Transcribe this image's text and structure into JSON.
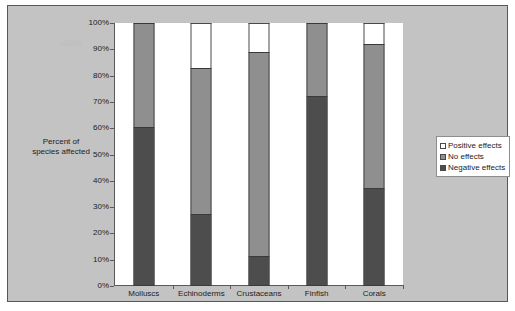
{
  "chart_data": {
    "type": "bar",
    "subtype": "stacked-bar-100-percent",
    "title": "",
    "xlabel": "",
    "ylabel": "Percent of species affected",
    "ylabel_lines": [
      "Percent of",
      "species affected"
    ],
    "categories": [
      "Molluscs",
      "Echinoderms",
      "Crustaceans",
      "Finfish",
      "Corals"
    ],
    "series": [
      {
        "name": "Negative effects",
        "color": "#4d4d4d",
        "values": [
          60,
          27,
          11,
          72,
          37
        ]
      },
      {
        "name": "No effects",
        "color": "#8f8f8f",
        "values": [
          40,
          56,
          78,
          28,
          55
        ]
      },
      {
        "name": "Positive effects",
        "color": "#ffffff",
        "values": [
          0,
          17,
          11,
          0,
          8
        ]
      }
    ],
    "stack_order_bottom_to_top": [
      "Negative effects",
      "No effects",
      "Positive effects"
    ],
    "ylim": [
      0,
      100
    ],
    "ytick_labels": [
      "100%",
      "90%",
      "80%",
      "70%",
      "60%",
      "50%",
      "40%",
      "30%",
      "20%",
      "10%",
      "0%"
    ],
    "ytick_values": [
      100,
      90,
      80,
      70,
      60,
      50,
      40,
      30,
      20,
      10,
      0
    ],
    "grid": false,
    "legend_position": "right-center",
    "legend_entries": [
      "Positive effects",
      "No effects",
      "Negative effects"
    ]
  },
  "legend": {
    "entries": [
      {
        "label": "Positive effects",
        "swatch": "positive"
      },
      {
        "label": "No effects",
        "swatch": "none"
      },
      {
        "label": "Negative effects",
        "swatch": "negative"
      }
    ]
  },
  "colors": {
    "plate_background": "#c3c3c3",
    "plot_background": "#ffffff",
    "axis_line": "#5a5a5a",
    "negative_effects": "#4d4d4d",
    "no_effects": "#8f8f8f",
    "positive_effects": "#ffffff",
    "text": "#1c1c1c"
  }
}
